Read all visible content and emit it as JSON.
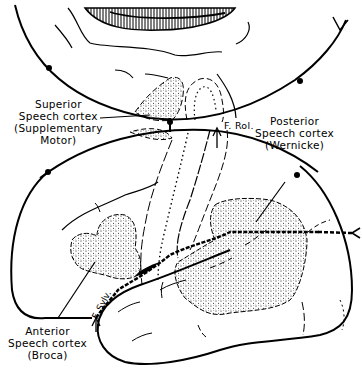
{
  "diagram": {
    "colors": {
      "ink": "#000000",
      "background": "#ffffff"
    },
    "labels": {
      "superior": {
        "line1": "Superior",
        "line2": "Speech cortex",
        "line3": "(Supplementary",
        "line4": "Motor)"
      },
      "posterior": {
        "line1": "Posterior",
        "line2": "Speech cortex",
        "line3": "(Wernicke)"
      },
      "anterior": {
        "line1": "Anterior",
        "line2": "Speech cortex",
        "line3": "(Broca)"
      },
      "fissure_rolando": "F. Rol.",
      "fissure_sylvius": "F. Sylv."
    },
    "regions": [
      {
        "name": "superior-speech-cortex",
        "fill": "stippled"
      },
      {
        "name": "posterior-speech-cortex",
        "fill": "stippled"
      },
      {
        "name": "anterior-speech-cortex",
        "fill": "stippled"
      },
      {
        "name": "corpus-callosum",
        "fill": "hatched"
      }
    ]
  }
}
